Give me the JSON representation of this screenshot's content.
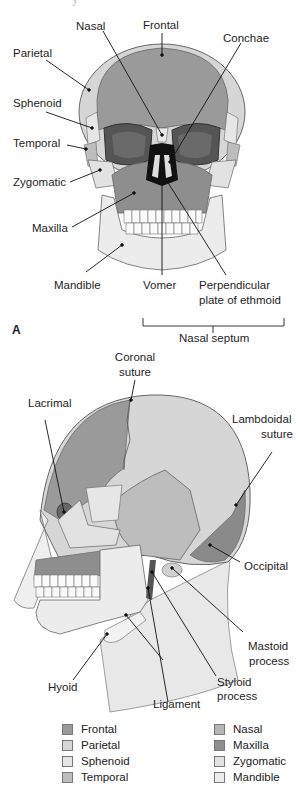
{
  "header_fragment": "y",
  "figure_a": {
    "panel_label": "A",
    "labels": {
      "nasal": "Nasal",
      "frontal": "Frontal",
      "conchae": "Conchae",
      "parietal": "Parietal",
      "sphenoid": "Sphenoid",
      "temporal": "Temporal",
      "zygomatic": "Zygomatic",
      "maxilla": "Maxilla",
      "mandible": "Mandible",
      "vomer": "Vomer",
      "perpendicular_1": "Perpendicular",
      "perpendicular_2": "plate of ethmoid",
      "nasal_septum": "Nasal septum"
    }
  },
  "figure_b": {
    "labels": {
      "coronal_1": "Coronal",
      "coronal_2": "suture",
      "lacrimal": "Lacrimal",
      "lambdoidal_1": "Lambdoidal",
      "lambdoidal_2": "suture",
      "occipital": "Occipital",
      "mastoid_1": "Mastoid",
      "mastoid_2": "process",
      "styloid_1": "Styloid",
      "styloid_2": "process",
      "hyoid": "Hyoid",
      "ligament": "Ligament"
    }
  },
  "legend": {
    "left": [
      {
        "label": "Frontal",
        "color": "#9a9a9a"
      },
      {
        "label": "Parietal",
        "color": "#d6d6d6"
      },
      {
        "label": "Sphenoid",
        "color": "#e6e6e6"
      },
      {
        "label": "Temporal",
        "color": "#bdbdbd"
      }
    ],
    "right": [
      {
        "label": "Nasal",
        "color": "#b5b5b5"
      },
      {
        "label": "Maxilla",
        "color": "#8e8e8e"
      },
      {
        "label": "Zygomatic",
        "color": "#e2e2e2"
      },
      {
        "label": "Mandible",
        "color": "#ececec"
      }
    ]
  },
  "colors": {
    "frontal": "#9a9a9a",
    "parietal": "#d6d6d6",
    "sphenoid": "#e6e6e6",
    "temporal": "#bdbdbd",
    "nasal": "#b5b5b5",
    "maxilla": "#8e8e8e",
    "zygomatic": "#e2e2e2",
    "mandible": "#ececec",
    "orbit": "#555555",
    "occipital": "#8a8a8a",
    "neck": "#e8e8e8"
  }
}
